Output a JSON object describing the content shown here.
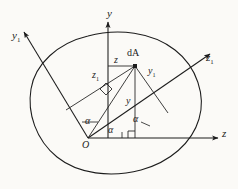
{
  "figure": {
    "background_color": "#fbfaf7",
    "stroke_color": "#1c1c1c"
  },
  "axes": [
    {
      "id": "y",
      "label": "y",
      "sub": "",
      "kind": "primary-vertical",
      "x": 107,
      "y": 14
    },
    {
      "id": "z",
      "label": "z",
      "sub": "",
      "kind": "primary-horizontal",
      "x": 222,
      "y": 133
    },
    {
      "id": "y1",
      "label": "y",
      "sub": "1",
      "kind": "rotated-vertical",
      "x": 12,
      "y": 35
    },
    {
      "id": "z1",
      "label": "z",
      "sub": "1",
      "kind": "rotated-horizontal",
      "x": 206,
      "y": 57
    }
  ],
  "points": [
    {
      "id": "origin",
      "label": "O",
      "sub": "",
      "x": 82,
      "y": 140
    },
    {
      "id": "element",
      "label": "dA",
      "sub": "",
      "x": 127,
      "y": 50
    }
  ],
  "segments": [
    {
      "id": "z-seg",
      "label": "z",
      "sub": "",
      "x": 112,
      "y": 57
    },
    {
      "id": "z1-seg",
      "label": "z",
      "sub": "1",
      "x": 92,
      "y": 72
    },
    {
      "id": "y-seg",
      "label": "y",
      "sub": "",
      "x": 127,
      "y": 97
    },
    {
      "id": "y1-seg",
      "label": "y",
      "sub": "1",
      "x": 148,
      "y": 68
    }
  ],
  "angles": [
    {
      "id": "alpha-y-axis",
      "label": "α",
      "x": 86,
      "y": 118
    },
    {
      "id": "alpha-origin",
      "label": "α",
      "x": 108,
      "y": 127
    },
    {
      "id": "alpha-element",
      "label": "α",
      "x": 131,
      "y": 117
    }
  ],
  "markers": [
    {
      "id": "right-angle-perp",
      "kind": "right-angle"
    },
    {
      "id": "right-angle-element",
      "kind": "right-angle"
    },
    {
      "id": "element-dot",
      "kind": "filled-square"
    }
  ],
  "body_outline": {
    "id": "cross-section-boundary",
    "kind": "closed-blob-curve"
  }
}
